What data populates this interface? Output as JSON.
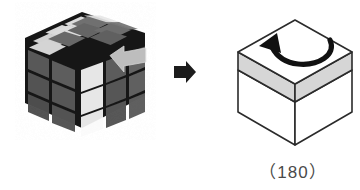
{
  "figure": {
    "kind": "rubiks-cube-rotation-diagram",
    "background_color": "#ffffff",
    "caption": "（180）"
  },
  "left_cube": {
    "name": "photographic-rubiks-cube",
    "description": "3x3x3 Rubik's cube photo, grayscale, viewed from upper-front-left",
    "colors": {
      "sticker_dark": "#585858",
      "sticker_dark_alt": "#4e4e4e",
      "sticker_light": "#e8e8e8",
      "sticker_white": "#fbfbfb",
      "sticker_top_dark": "#707070",
      "grid_black": "#191919",
      "overlay_arrow": "#c9c9c9"
    },
    "faces": {
      "top": {
        "label": "top-face",
        "rows": [
          [
            "light",
            "light",
            "dark"
          ],
          [
            "light",
            "light",
            "dark"
          ],
          [
            "light",
            "dark",
            "dark"
          ]
        ]
      },
      "left": {
        "label": "left-face",
        "rows": [
          [
            "dark",
            "dark"
          ],
          [
            "dark",
            "dark"
          ],
          [
            "dark",
            "dark"
          ]
        ]
      },
      "right": {
        "label": "right-face",
        "rows": [
          [
            "white",
            "dark",
            "dark"
          ],
          [
            "white",
            "dark",
            "dark"
          ],
          [
            "white",
            "dark",
            "dark"
          ]
        ]
      }
    },
    "overlay_arrow": {
      "name": "gray-left-arrow-overlay",
      "direction": "left",
      "color": "#c9c9c9"
    }
  },
  "transition_arrow": {
    "name": "black-right-arrow",
    "direction": "right",
    "color": "#1a1a1a"
  },
  "right_cube": {
    "name": "schematic-line-cube",
    "description": "Line-art isometric cube with shaded top layer band and curved rotation arrow on the top face",
    "colors": {
      "outline": "#2b2b2b",
      "face_fill": "#ffffff",
      "band_fill": "#d6d6d6",
      "arrow": "#111111"
    },
    "top_layer_band": {
      "name": "highlighted-top-layer",
      "fill": "#d6d6d6"
    },
    "rotation_arrow": {
      "name": "curved-rotation-arrow",
      "sweep": "counterclockwise",
      "points_to": "upper-left"
    }
  }
}
